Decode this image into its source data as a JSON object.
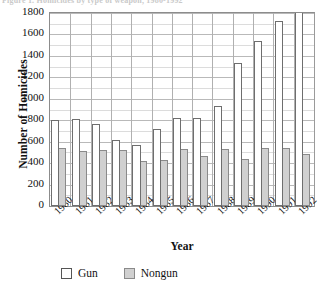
{
  "figure": {
    "caption_fragment": "Figure 1.  Homicides by type of weapon, 1980-1992"
  },
  "chart_data": {
    "type": "bar",
    "title": "",
    "xlabel": "Year",
    "ylabel": "Number of Homicides",
    "categories": [
      "1980",
      "1981",
      "1982",
      "1983",
      "1984",
      "1985",
      "1986",
      "1987",
      "1988",
      "1989",
      "1990",
      "1991",
      "1992"
    ],
    "series": [
      {
        "name": "Gun",
        "color": "#ffffff",
        "values": [
          805,
          808,
          762,
          612,
          565,
          720,
          822,
          825,
          930,
          1330,
          1540,
          1730,
          1890
        ]
      },
      {
        "name": "Nongun",
        "color": "#d0d0d0",
        "values": [
          545,
          512,
          518,
          518,
          422,
          425,
          528,
          465,
          535,
          438,
          540,
          545,
          485
        ]
      }
    ],
    "ylim": [
      0,
      1800
    ],
    "ytick_step": 200,
    "yticks": [
      "0",
      "200",
      "400",
      "600",
      "800",
      "1000",
      "1200",
      "1400",
      "1600",
      "1800"
    ],
    "grid": true,
    "minor_grid": true,
    "legend_position": "bottom"
  },
  "legend": {
    "items": [
      {
        "label": "Gun"
      },
      {
        "label": "Nongun"
      }
    ]
  }
}
